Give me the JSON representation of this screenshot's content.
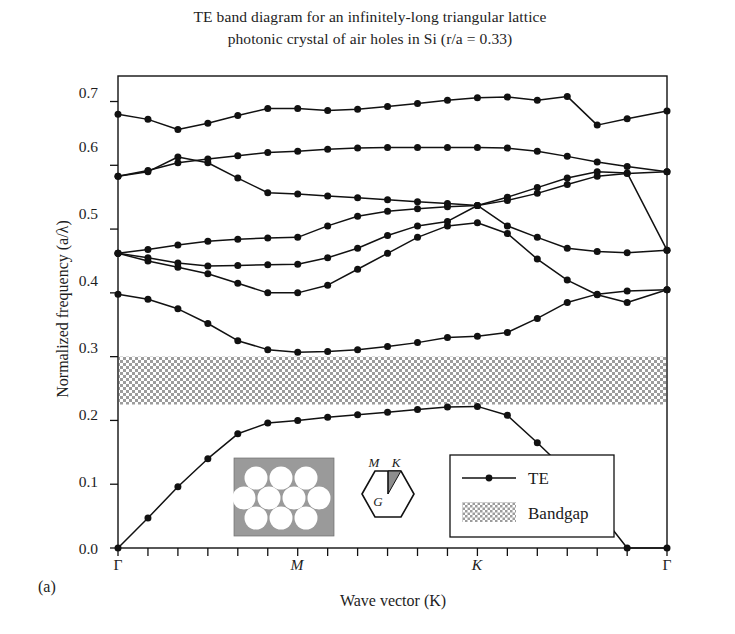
{
  "figure": {
    "panel_letter": "(a)",
    "title_line_1": "TE band diagram for an infinitely-long triangular lattice",
    "title_line_2": "photonic crystal of air holes in Si (r/a = 0.33)"
  },
  "axes": {
    "ylabel": "Normalized frequency (a/λ)",
    "xlabel": "Wave vector (K)",
    "y_ticks": [
      "0.0",
      "0.1",
      "0.2",
      "0.3",
      "0.4",
      "0.5",
      "0.6",
      "0.7"
    ],
    "x_ticks": [
      "Γ",
      "M",
      "K",
      "Γ"
    ]
  },
  "legend": {
    "te_label": "TE",
    "bandgap_label": "Bandgap"
  },
  "insets": {
    "lattice": {
      "name": "triangular-lattice-air-holes",
      "background_color": "#9a9a9a",
      "hole_color": "#ffffff",
      "rows": [
        3,
        4,
        3
      ]
    },
    "brillouin_zone": {
      "name": "brillouin-zone-hexagon",
      "label_gamma": "G",
      "label_m": "M",
      "label_k": "K",
      "wedge_color": "#8d8d8d"
    }
  },
  "colors": {
    "line": "#111111",
    "marker": "#111111",
    "bandgap_fill": "#a8a8a8",
    "frame": "#111111"
  },
  "chart_data": {
    "type": "line",
    "title": "TE band diagram for an infinitely-long triangular lattice photonic crystal of air holes in Si (r/a = 0.33)",
    "xlabel": "Wave vector (K)",
    "ylabel": "Normalized frequency (a/λ)",
    "ylim": [
      0.0,
      0.74
    ],
    "grid": false,
    "legend_position": "inside-bottom-right",
    "symmetry_points": [
      {
        "label": "Γ",
        "x": 0.0
      },
      {
        "label": "M",
        "x": 6.0
      },
      {
        "label": "K",
        "x": 12.0
      },
      {
        "label": "Γ",
        "x": 18.33
      }
    ],
    "x": [
      0,
      1,
      2,
      3,
      4,
      5,
      6,
      7,
      8,
      9,
      10,
      11,
      12,
      13,
      14,
      15,
      16,
      17,
      18.33
    ],
    "xlim": [
      0,
      18.33
    ],
    "bandgap": {
      "ymin": 0.225,
      "ymax": 0.3,
      "label": "Bandgap"
    },
    "series": [
      {
        "name": "TE band 1",
        "values": [
          0.0,
          0.047,
          0.096,
          0.14,
          0.179,
          0.196,
          0.2,
          0.205,
          0.209,
          0.213,
          0.217,
          0.221,
          0.222,
          0.208,
          0.165,
          0.12,
          0.06,
          0.0,
          0.0
        ]
      },
      {
        "name": "TE band 2",
        "values": [
          0.398,
          0.39,
          0.375,
          0.352,
          0.325,
          0.311,
          0.307,
          0.308,
          0.311,
          0.316,
          0.322,
          0.33,
          0.332,
          0.338,
          0.36,
          0.385,
          0.398,
          0.403,
          0.405
        ]
      },
      {
        "name": "TE band 3",
        "values": [
          0.462,
          0.45,
          0.44,
          0.43,
          0.415,
          0.4,
          0.4,
          0.412,
          0.437,
          0.462,
          0.487,
          0.505,
          0.51,
          0.493,
          0.453,
          0.42,
          0.397,
          0.385,
          0.405
        ]
      },
      {
        "name": "TE band 4",
        "values": [
          0.462,
          0.455,
          0.447,
          0.442,
          0.443,
          0.444,
          0.445,
          0.455,
          0.47,
          0.49,
          0.505,
          0.512,
          0.537,
          0.505,
          0.487,
          0.47,
          0.465,
          0.463,
          0.467
        ]
      },
      {
        "name": "TE band 5",
        "values": [
          0.462,
          0.468,
          0.475,
          0.481,
          0.484,
          0.486,
          0.487,
          0.505,
          0.52,
          0.528,
          0.532,
          0.535,
          0.537,
          0.55,
          0.565,
          0.58,
          0.59,
          0.588,
          0.467
        ]
      },
      {
        "name": "TE band 6",
        "values": [
          0.583,
          0.59,
          0.613,
          0.604,
          0.58,
          0.557,
          0.555,
          0.552,
          0.549,
          0.546,
          0.543,
          0.54,
          0.537,
          0.545,
          0.556,
          0.57,
          0.583,
          0.587,
          0.59
        ]
      },
      {
        "name": "TE band 7",
        "values": [
          0.583,
          0.592,
          0.604,
          0.61,
          0.615,
          0.62,
          0.622,
          0.625,
          0.627,
          0.628,
          0.628,
          0.628,
          0.628,
          0.627,
          0.622,
          0.614,
          0.605,
          0.598,
          0.59
        ]
      },
      {
        "name": "TE band 8",
        "values": [
          0.68,
          0.672,
          0.656,
          0.666,
          0.678,
          0.689,
          0.689,
          0.686,
          0.688,
          0.692,
          0.697,
          0.702,
          0.706,
          0.707,
          0.702,
          0.708,
          0.663,
          0.673,
          0.685
        ]
      }
    ]
  }
}
